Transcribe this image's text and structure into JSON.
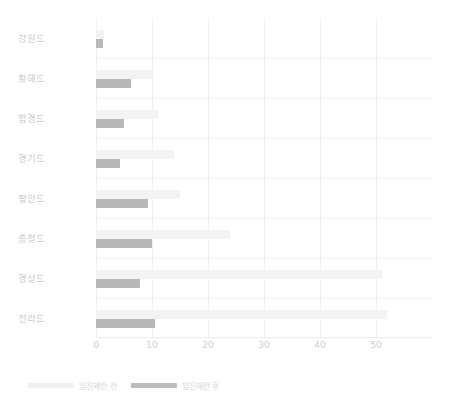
{
  "chart_data": {
    "type": "bar",
    "orientation": "horizontal",
    "title": "",
    "xlabel": "",
    "ylabel": "",
    "xlim": [
      0,
      60
    ],
    "xticks": [
      0,
      10,
      20,
      30,
      40,
      50
    ],
    "xtick_labels": [
      "0",
      "10",
      "20",
      "30",
      "40",
      "50"
    ],
    "grid": true,
    "grid_axis": "both",
    "legend_position": "bottom-left",
    "categories": [
      "강원도",
      "황해도",
      "함경도",
      "경기도",
      "평안도",
      "충청도",
      "경상도",
      "전라도"
    ],
    "series": [
      {
        "name": "임진왜란 전",
        "color": "#f4f3f3",
        "values": [
          1.5,
          10.0,
          11.0,
          14.0,
          15.0,
          24.0,
          51.0,
          52.0
        ]
      },
      {
        "name": "임진왜란 후",
        "color": "#b8b8b8",
        "values": [
          1.3,
          6.3,
          5.0,
          4.3,
          9.3,
          10.0,
          7.8,
          10.5
        ]
      }
    ]
  },
  "legend": {
    "items": [
      {
        "label": "임진왜란 전",
        "swatch": "before"
      },
      {
        "label": "임진왜란 후",
        "swatch": "after"
      }
    ]
  },
  "colors": {
    "background": "#ffffff",
    "grid": "#f0eeee",
    "axis": "#e6e4e4",
    "series_before": "#f4f3f3",
    "series_after": "#b8b8b8",
    "tick_text": "#cfcdcd"
  }
}
